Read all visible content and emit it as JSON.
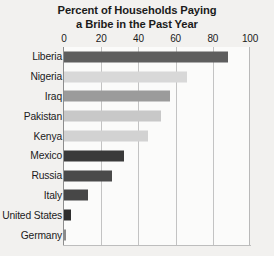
{
  "chart_data": {
    "type": "bar",
    "orientation": "horizontal",
    "title": "Percent of Households Paying a Bribe in the Past Year",
    "title_lines": [
      "Percent of Households Paying",
      "a Bribe in the Past Year"
    ],
    "xlabel": "",
    "ylabel": "",
    "xlim": [
      0,
      100
    ],
    "xticks": [
      0,
      20,
      40,
      60,
      80,
      100
    ],
    "xtick_labels": [
      "0",
      "20",
      "40",
      "60",
      "80",
      "100"
    ],
    "grid": "vertical",
    "legend": "none",
    "categories": [
      "Liberia",
      "Nigeria",
      "Iraq",
      "Pakistan",
      "Kenya",
      "Mexico",
      "Russia",
      "Italy",
      "United States",
      "Germany"
    ],
    "values": [
      88,
      66,
      57,
      52,
      45,
      32,
      26,
      13,
      4,
      1
    ],
    "bar_colors": [
      "#5e5e5e",
      "#d8d8d8",
      "#9b9b9b",
      "#c8c8c8",
      "#d2d2d2",
      "#3a3a3a",
      "#4a4a4a",
      "#474747",
      "#2f2f2f",
      "#8a8a8a"
    ]
  },
  "colors": {
    "background": "#f2f1ef",
    "plot_background": "#fbfbfa",
    "gridline": "#c3c3c3",
    "axis": "#8d8d8d",
    "text": "#1b1b1b"
  }
}
